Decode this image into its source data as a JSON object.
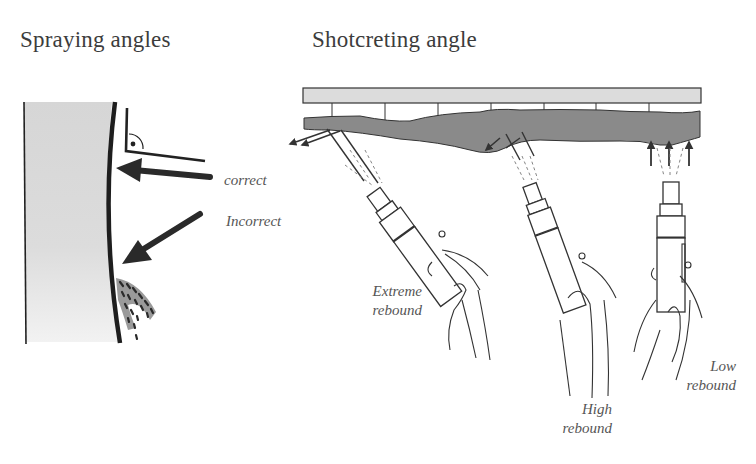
{
  "titles": {
    "left": "Spraying angles",
    "right": "Shotcreting  angle"
  },
  "left_panel": {
    "labels": {
      "correct": "correct",
      "incorrect": "Incorrect"
    },
    "elements": [
      "rock-wall",
      "shotcrete-layer-edge",
      "right-angle-marker",
      "correct-arrow",
      "incorrect-arrow",
      "rebound-splatter"
    ]
  },
  "right_panel": {
    "nozzles": [
      {
        "id": "extreme",
        "line1": "Extreme",
        "line2": "rebound"
      },
      {
        "id": "high",
        "line1": "High",
        "line2": "rebound"
      },
      {
        "id": "low",
        "line1": "Low",
        "line2": "rebound"
      }
    ],
    "elements": [
      "ceiling-slab",
      "support-bolts",
      "shotcrete-layer",
      "rebound-arrows",
      "nozzles",
      "hands"
    ]
  },
  "colors": {
    "text": "#3c3c3c",
    "label": "#555555",
    "stroke": "#222222",
    "wall_fill": "#d9d9d9",
    "shotcrete_fill": "#8a8a8a",
    "slab_fill": "#dcdcdc",
    "splatter_fill": "#9a9a9a"
  }
}
